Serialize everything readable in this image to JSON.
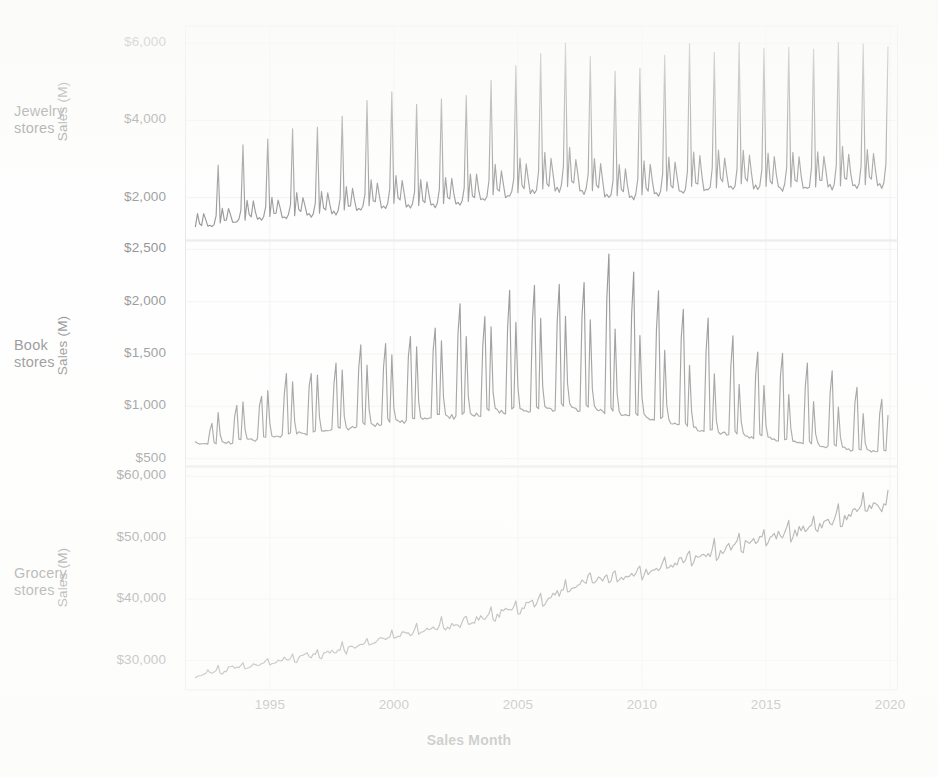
{
  "chart_data": {
    "type": "line",
    "title": "",
    "subtitle": "",
    "xlabel": "Sales Month",
    "ylabel": "Sales (M)",
    "grid": true,
    "legend_position": "none",
    "line_color": "#4d4d4d",
    "gridline_color": "#e3e3e0",
    "axis_color": "#cfcfcb",
    "facet_layout": "vertical-stack",
    "x": {
      "label": "Sales Month",
      "ticks": [
        "1995",
        "2000",
        "2005",
        "2010",
        "2015",
        "2020"
      ],
      "tick_values": [
        1995,
        2000,
        2005,
        2010,
        2015,
        2020
      ],
      "range": [
        1991.6,
        2020.3
      ],
      "unit": "year"
    },
    "panels": [
      {
        "name": "Jewelry stores",
        "label_lines": [
          "Jewelry",
          "stores"
        ],
        "ylabel": "Sales (M)",
        "yticks": [
          "$2,000",
          "$4,000",
          "$6,000"
        ],
        "ytick_values": [
          2000,
          4000,
          6000
        ],
        "ylim": [
          900,
          6450
        ],
        "series_name": "Jewelry stores",
        "seasonal_peak_month": "December",
        "annual": [
          {
            "year": 1992,
            "base": 1180,
            "peak": 2430
          },
          {
            "year": 1993,
            "base": 1240,
            "peak": 2830
          },
          {
            "year": 1994,
            "base": 1310,
            "peak": 3430
          },
          {
            "year": 1995,
            "base": 1380,
            "peak": 3560
          },
          {
            "year": 1996,
            "base": 1420,
            "peak": 3760
          },
          {
            "year": 1997,
            "base": 1460,
            "peak": 3760
          },
          {
            "year": 1998,
            "base": 1520,
            "peak": 4060
          },
          {
            "year": 1999,
            "base": 1600,
            "peak": 4530
          },
          {
            "year": 2000,
            "base": 1680,
            "peak": 4680
          },
          {
            "year": 2001,
            "base": 1660,
            "peak": 4360
          },
          {
            "year": 2002,
            "base": 1700,
            "peak": 4500
          },
          {
            "year": 2003,
            "base": 1760,
            "peak": 4710
          },
          {
            "year": 2004,
            "base": 1850,
            "peak": 5140
          },
          {
            "year": 2005,
            "base": 1930,
            "peak": 5380
          },
          {
            "year": 2006,
            "base": 2010,
            "peak": 5800
          },
          {
            "year": 2007,
            "base": 2060,
            "peak": 6130
          },
          {
            "year": 2008,
            "base": 1980,
            "peak": 5520
          },
          {
            "year": 2009,
            "base": 1830,
            "peak": 5250
          },
          {
            "year": 2010,
            "base": 1880,
            "peak": 5470
          },
          {
            "year": 2011,
            "base": 1960,
            "peak": 5730
          },
          {
            "year": 2012,
            "base": 2030,
            "peak": 5900
          },
          {
            "year": 2013,
            "base": 2060,
            "peak": 5870
          },
          {
            "year": 2014,
            "base": 2100,
            "peak": 5960
          },
          {
            "year": 2015,
            "base": 2090,
            "peak": 5810
          },
          {
            "year": 2016,
            "base": 2080,
            "peak": 5820
          },
          {
            "year": 2017,
            "base": 2090,
            "peak": 5900
          },
          {
            "year": 2018,
            "base": 2120,
            "peak": 5930
          },
          {
            "year": 2019,
            "base": 2150,
            "peak": 5950
          }
        ]
      },
      {
        "name": "Book stores",
        "label_lines": [
          "Book",
          "stores"
        ],
        "ylabel": "Sales (M)",
        "yticks": [
          "$500",
          "$1,000",
          "$1,500",
          "$2,000",
          "$2,500"
        ],
        "ytick_values": [
          500,
          1000,
          1500,
          2000,
          2500
        ],
        "ylim": [
          430,
          2580
        ],
        "series_name": "Book stores",
        "seasonal_peak_month": "September (back-to-school) and December",
        "annual": [
          {
            "year": 1992,
            "base": 620,
            "peak": 840,
            "peak2": 790
          },
          {
            "year": 1993,
            "base": 640,
            "peak": 1010,
            "peak2": 960
          },
          {
            "year": 1994,
            "base": 660,
            "peak": 1120,
            "peak2": 1060
          },
          {
            "year": 1995,
            "base": 690,
            "peak": 1290,
            "peak2": 1180
          },
          {
            "year": 1996,
            "base": 720,
            "peak": 1340,
            "peak2": 1230
          },
          {
            "year": 1997,
            "base": 740,
            "peak": 1420,
            "peak2": 1300
          },
          {
            "year": 1998,
            "base": 760,
            "peak": 1570,
            "peak2": 1360
          },
          {
            "year": 1999,
            "base": 800,
            "peak": 1620,
            "peak2": 1420
          },
          {
            "year": 2000,
            "base": 830,
            "peak": 1680,
            "peak2": 1490
          },
          {
            "year": 2001,
            "base": 850,
            "peak": 1770,
            "peak2": 1560
          },
          {
            "year": 2002,
            "base": 880,
            "peak": 1990,
            "peak2": 1640
          },
          {
            "year": 2003,
            "base": 890,
            "peak": 1870,
            "peak2": 1680
          },
          {
            "year": 2004,
            "base": 920,
            "peak": 2090,
            "peak2": 1740
          },
          {
            "year": 2005,
            "base": 940,
            "peak": 2150,
            "peak2": 1800
          },
          {
            "year": 2006,
            "base": 950,
            "peak": 2130,
            "peak2": 1830
          },
          {
            "year": 2007,
            "base": 960,
            "peak": 2220,
            "peak2": 1870
          },
          {
            "year": 2008,
            "base": 950,
            "peak": 2410,
            "peak2": 1840
          },
          {
            "year": 2009,
            "base": 900,
            "peak": 2260,
            "peak2": 1740
          },
          {
            "year": 2010,
            "base": 880,
            "peak": 2090,
            "peak2": 1660
          },
          {
            "year": 2011,
            "base": 830,
            "peak": 1960,
            "peak2": 1530
          },
          {
            "year": 2012,
            "base": 770,
            "peak": 1830,
            "peak2": 1410
          },
          {
            "year": 2013,
            "base": 730,
            "peak": 1640,
            "peak2": 1290
          },
          {
            "year": 2014,
            "base": 700,
            "peak": 1530,
            "peak2": 1220
          },
          {
            "year": 2015,
            "base": 680,
            "peak": 1520,
            "peak2": 1190
          },
          {
            "year": 2016,
            "base": 650,
            "peak": 1430,
            "peak2": 1130
          },
          {
            "year": 2017,
            "base": 620,
            "peak": 1330,
            "peak2": 1060
          },
          {
            "year": 2018,
            "base": 590,
            "peak": 1200,
            "peak2": 980
          },
          {
            "year": 2019,
            "base": 560,
            "peak": 1080,
            "peak2": 930
          }
        ]
      },
      {
        "name": "Grocery stores",
        "label_lines": [
          "Grocery",
          "stores"
        ],
        "ylabel": "Sales (M)",
        "yticks": [
          "$30,000",
          "$40,000",
          "$50,000",
          "$60,000"
        ],
        "ytick_values": [
          30000,
          40000,
          50000,
          60000
        ],
        "ylim": [
          25200,
          61500
        ],
        "series_name": "Grocery stores",
        "seasonal_peak_month": "December",
        "annual": [
          {
            "year": 1992,
            "base": 27300,
            "peak": 28600
          },
          {
            "year": 1993,
            "base": 27900,
            "peak": 29200
          },
          {
            "year": 1994,
            "base": 28500,
            "peak": 29900
          },
          {
            "year": 1995,
            "base": 29200,
            "peak": 30600
          },
          {
            "year": 1996,
            "base": 30000,
            "peak": 31500
          },
          {
            "year": 1997,
            "base": 30600,
            "peak": 32100
          },
          {
            "year": 1998,
            "base": 31300,
            "peak": 32900
          },
          {
            "year": 1999,
            "base": 32300,
            "peak": 34000
          },
          {
            "year": 2000,
            "base": 33300,
            "peak": 35100
          },
          {
            "year": 2001,
            "base": 34300,
            "peak": 36200
          },
          {
            "year": 2002,
            "base": 34900,
            "peak": 36800
          },
          {
            "year": 2003,
            "base": 35600,
            "peak": 37600
          },
          {
            "year": 2004,
            "base": 36600,
            "peak": 38700
          },
          {
            "year": 2005,
            "base": 37800,
            "peak": 40000
          },
          {
            "year": 2006,
            "base": 39100,
            "peak": 41400
          },
          {
            "year": 2007,
            "base": 40700,
            "peak": 43200
          },
          {
            "year": 2008,
            "base": 42400,
            "peak": 44800
          },
          {
            "year": 2009,
            "base": 42700,
            "peak": 45000
          },
          {
            "year": 2010,
            "base": 43300,
            "peak": 45700
          },
          {
            "year": 2011,
            "base": 44600,
            "peak": 47200
          },
          {
            "year": 2012,
            "base": 45800,
            "peak": 48400
          },
          {
            "year": 2013,
            "base": 46700,
            "peak": 49400
          },
          {
            "year": 2014,
            "base": 47900,
            "peak": 50700
          },
          {
            "year": 2015,
            "base": 48900,
            "peak": 51800
          },
          {
            "year": 2016,
            "base": 49600,
            "peak": 52500
          },
          {
            "year": 2017,
            "base": 50700,
            "peak": 53700
          },
          {
            "year": 2018,
            "base": 52200,
            "peak": 55300
          },
          {
            "year": 2019,
            "base": 53800,
            "peak": 57200
          }
        ]
      }
    ]
  }
}
